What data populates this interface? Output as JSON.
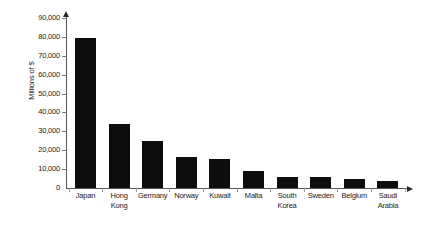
{
  "chart_data": {
    "type": "bar",
    "title": "",
    "xlabel": "",
    "ylabel": "Millions of $",
    "ylim": [
      0,
      90000
    ],
    "ytick_values": [
      0,
      10000,
      20000,
      30000,
      40000,
      50000,
      60000,
      70000,
      80000,
      90000
    ],
    "ytick_labels": [
      "0",
      "10,000",
      "20,000",
      "30,000",
      "40,000",
      "50,000",
      "60,000",
      "70,000",
      "80,000",
      "90,000"
    ],
    "grid": false,
    "legend": null,
    "bar_color": "#0d0d0d",
    "axis_color": "#555555",
    "categories": [
      "Japan",
      "Hong Kong",
      "Germany",
      "Norway",
      "Kuwait",
      "Malta",
      "South Korea",
      "Sweden",
      "Belgium",
      "Saudi Arabia"
    ],
    "values": [
      79500,
      34000,
      25000,
      16500,
      15500,
      9000,
      6000,
      5800,
      5000,
      3500
    ]
  },
  "bottom_caption": ""
}
